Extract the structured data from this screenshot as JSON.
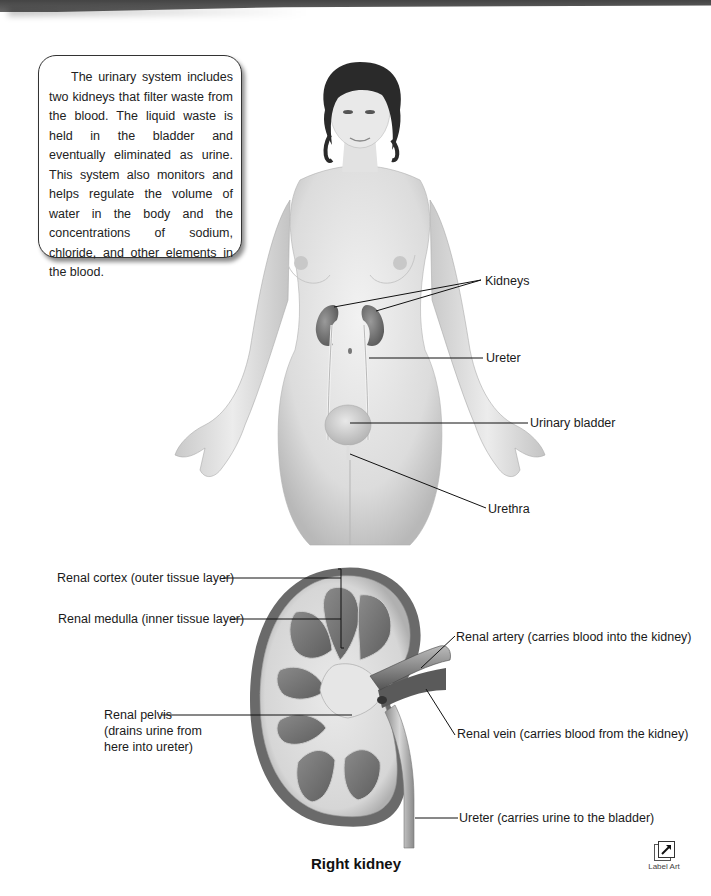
{
  "callout": {
    "text": "The urinary system includes two kidneys that filter waste from the blood. The liquid waste is held in the bladder and eventually eliminated as urine. This system also monitors and helps regulate the volume of water in the body and the concentrations of sodium, chloride, and other elements in the blood."
  },
  "body_figure": {
    "labels": {
      "kidneys": "Kidneys",
      "ureter": "Ureter",
      "urinary_bladder": "Urinary bladder",
      "urethra": "Urethra"
    }
  },
  "kidney_figure": {
    "caption": "Right kidney",
    "labels": {
      "renal_cortex": "Renal cortex (outer tissue layer)",
      "renal_medulla": "Renal medulla (inner tissue layer)",
      "renal_pelvis_1": "Renal pelvis",
      "renal_pelvis_2": "(drains urine from",
      "renal_pelvis_3": "here into ureter)",
      "renal_artery": "Renal artery (carries blood into the kidney)",
      "renal_vein": "Renal vein (carries blood from the kidney)",
      "ureter": "Ureter (carries urine to the bladder)"
    }
  },
  "label_art_button": {
    "label": "Label Art",
    "icon": "expand-arrow-icon"
  }
}
